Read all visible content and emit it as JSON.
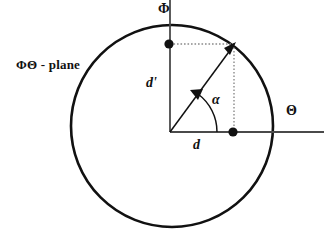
{
  "figure": {
    "plane_label": "ΦΘ - plane",
    "axis_vertical_label": "Φ",
    "axis_horizontal_label": "Θ",
    "vector_projection_y_label": "d'",
    "vector_projection_x_label": "d",
    "angle_label": "α",
    "colors": {
      "stroke": "#111111",
      "axis": "#4a4a4a",
      "dotted": "#8a8a8a",
      "background": "#ffffff"
    },
    "geometry": {
      "circle_center": [
        172,
        126
      ],
      "circle_radius": 101,
      "origin": [
        170,
        132
      ],
      "vector_tip": [
        234,
        45
      ],
      "point_on_theta_axis": [
        233,
        132
      ],
      "point_on_phi_axis": [
        169,
        44
      ],
      "angle_arc_radius": 47
    }
  }
}
